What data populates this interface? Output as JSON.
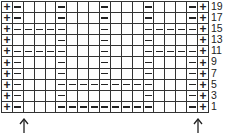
{
  "chart": {
    "title": "",
    "columns": 19,
    "symbols": {
      "knit": "+",
      "purl": "−",
      "blank": ""
    },
    "row_labels": [
      "19",
      "17",
      "15",
      "13",
      "11",
      "9",
      "7",
      "5",
      "3",
      "1"
    ],
    "rows": [
      {
        "label": "19",
        "cells": [
          "+",
          "−",
          "",
          "",
          "",
          "−",
          "",
          "",
          "",
          "−",
          "",
          "",
          "",
          "−",
          "",
          "",
          "",
          "−",
          "+"
        ]
      },
      {
        "label": "17",
        "cells": [
          "+",
          "−",
          "",
          "",
          "",
          "−",
          "",
          "",
          "",
          "−",
          "",
          "",
          "",
          "−",
          "",
          "",
          "",
          "−",
          "+"
        ]
      },
      {
        "label": "15",
        "cells": [
          "+",
          "−",
          "−",
          "−",
          "−",
          "−",
          "",
          "",
          "",
          "−",
          "",
          "",
          "",
          "−",
          "−",
          "−",
          "−",
          "−",
          "+"
        ]
      },
      {
        "label": "13",
        "cells": [
          "+",
          "",
          "",
          "",
          "",
          "−",
          "",
          "",
          "",
          "−",
          "",
          "",
          "",
          "−",
          "",
          "",
          "",
          "",
          "+"
        ]
      },
      {
        "label": "11",
        "cells": [
          "+",
          "−",
          "−",
          "−",
          "−",
          "−",
          "",
          "",
          "",
          "−",
          "",
          "",
          "",
          "−",
          "−",
          "−",
          "−",
          "−",
          "+"
        ]
      },
      {
        "label": "9",
        "cells": [
          "+",
          "−",
          "",
          "",
          "",
          "−",
          "",
          "",
          "",
          "−",
          "",
          "",
          "",
          "−",
          "",
          "",
          "",
          "−",
          "+"
        ]
      },
      {
        "label": "7",
        "cells": [
          "+",
          "−",
          "",
          "",
          "",
          "−",
          "",
          "",
          "",
          "−",
          "",
          "",
          "",
          "−",
          "",
          "",
          "",
          "−",
          "+"
        ]
      },
      {
        "label": "5",
        "cells": [
          "+",
          "−",
          "",
          "",
          "",
          "−",
          "−",
          "−",
          "−",
          "−",
          "−",
          "−",
          "−",
          "−",
          "",
          "",
          "",
          "−",
          "+"
        ]
      },
      {
        "label": "3",
        "cells": [
          "+",
          "−",
          "",
          "",
          "",
          "−",
          "",
          "",
          "",
          "",
          "",
          "",
          "",
          "−",
          "",
          "",
          "",
          "−",
          "+"
        ]
      },
      {
        "label": "1",
        "cells": [
          "+",
          "−",
          "",
          "",
          "",
          "−",
          "−",
          "−",
          "−",
          "−",
          "−",
          "−",
          "−",
          "−",
          "",
          "",
          "",
          "−",
          "+"
        ]
      }
    ],
    "arrows": [
      {
        "name": "start-marker-left",
        "x": 19
      },
      {
        "name": "start-marker-right",
        "x": 193
      }
    ],
    "colors": {
      "line": "#333333",
      "symbol": "#222222",
      "background": "#ffffff"
    }
  }
}
